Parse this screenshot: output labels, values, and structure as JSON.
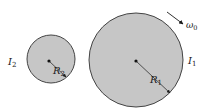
{
  "diagram": {
    "colors": {
      "disk_fill": "#c6c6c6",
      "disk_stroke": "#444444",
      "ink": "#1a1a1a",
      "background": "#ffffff"
    },
    "disk_small": {
      "inertia_label": "I",
      "inertia_sub": "2",
      "radius_label": "R",
      "radius_sub": "2"
    },
    "disk_large": {
      "inertia_label": "I",
      "inertia_sub": "1",
      "radius_label": "R",
      "radius_sub": "1"
    },
    "rotation": {
      "label": "ω",
      "sub": "0"
    }
  }
}
